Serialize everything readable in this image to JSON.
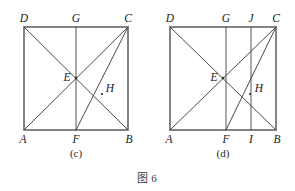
{
  "figure": {
    "caption": "图 6",
    "panels": [
      {
        "id": "c",
        "sub_caption": "(c)",
        "shape": "rectangle",
        "vertex_labels": {
          "top_left": "D",
          "top_mid": "G",
          "top_right": "C",
          "bottom_left": "A",
          "bottom_mid": "F",
          "bottom_right": "B",
          "center": "E",
          "inner": "H"
        },
        "segments": [
          "A-B",
          "B-C",
          "C-D",
          "D-A",
          "G-F",
          "A-C",
          "D-B",
          "C-F"
        ],
        "geometry": {
          "left": 24,
          "right": 128,
          "top": 27,
          "bottom": 130,
          "mid_x": 76,
          "E": [
            76,
            78
          ],
          "H": [
            102,
            94
          ]
        }
      },
      {
        "id": "d",
        "sub_caption": "(d)",
        "shape": "rectangle",
        "vertex_labels": {
          "top_left": "D",
          "top_mid": "G",
          "top_quarter": "J",
          "top_right": "C",
          "bottom_left": "A",
          "bottom_mid": "F",
          "bottom_quarter": "I",
          "bottom_right": "B",
          "center": "E",
          "inner": "H"
        },
        "segments": [
          "A-B",
          "B-C",
          "C-D",
          "D-A",
          "G-F",
          "J-I",
          "A-C",
          "D-B",
          "C-F"
        ],
        "geometry": {
          "left": 170,
          "right": 276,
          "top": 27,
          "bottom": 130,
          "mid_x": 226,
          "quarter_x": 251,
          "E": [
            223,
            78
          ],
          "H": [
            250,
            94
          ]
        }
      }
    ]
  },
  "colors": {
    "background": "#ffffff",
    "edge": "#2b2b2b",
    "inner_line": "#4a4a4a",
    "label": "#1a1a1a"
  }
}
